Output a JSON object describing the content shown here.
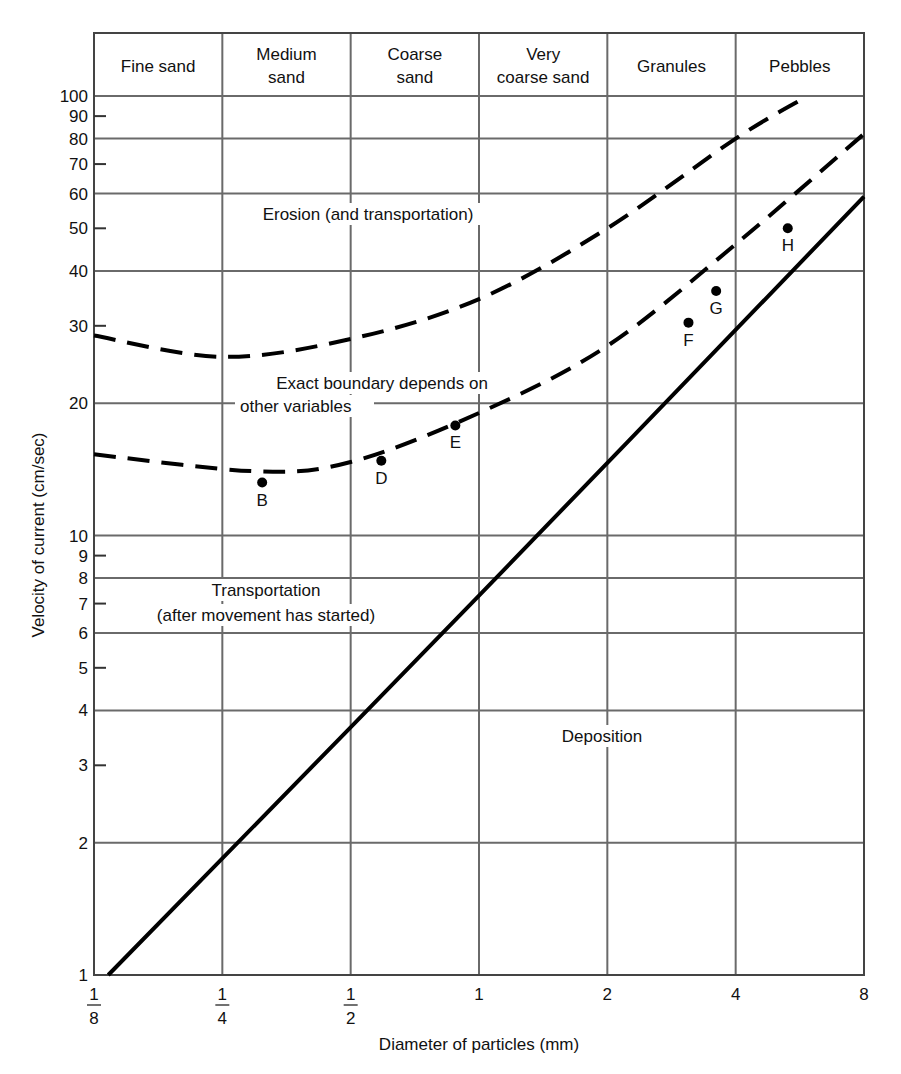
{
  "chart_data": {
    "type": "line",
    "title": "",
    "xlabel": "Diameter of particles (mm)",
    "ylabel": "Velocity of current (cm/sec)",
    "x_scale": "log2",
    "y_scale": "log10",
    "xlim": [
      0.125,
      8
    ],
    "ylim": [
      1,
      100
    ],
    "grid": true,
    "x_ticks": [
      {
        "value": 0.125,
        "num": "1",
        "den": "8"
      },
      {
        "value": 0.25,
        "num": "1",
        "den": "4"
      },
      {
        "value": 0.5,
        "num": "1",
        "den": "2"
      },
      {
        "value": 1,
        "label": "1"
      },
      {
        "value": 2,
        "label": "2"
      },
      {
        "value": 4,
        "label": "4"
      },
      {
        "value": 8,
        "label": "8"
      }
    ],
    "y_gridlines": [
      1,
      2,
      4,
      6,
      8,
      10,
      20,
      40,
      60,
      80,
      100
    ],
    "y_minor_ticks": [
      3,
      5,
      7,
      9,
      30,
      50,
      70,
      90
    ],
    "y_tick_labels": [
      "1",
      "2",
      "3",
      "4",
      "5",
      "6",
      "7",
      "8",
      "9",
      "10",
      "20",
      "30",
      "40",
      "50",
      "60",
      "70",
      "80",
      "90",
      "100"
    ],
    "size_classes": [
      "Fine sand",
      "Medium sand",
      "Coarse sand",
      "Very coarse sand",
      "Granules",
      "Pebbles"
    ],
    "series": [
      {
        "name": "Erosion threshold (upper dashed)",
        "style": "dashed",
        "x": [
          0.125,
          0.25,
          0.5,
          1,
          2,
          4,
          5.9
        ],
        "values": [
          28.5,
          25.5,
          28,
          34.5,
          50,
          80,
          100
        ]
      },
      {
        "name": "Erosion threshold (lower dashed)",
        "style": "dashed",
        "x": [
          0.125,
          0.3,
          0.5,
          1,
          2,
          4,
          8
        ],
        "values": [
          15.3,
          14,
          14.7,
          19,
          27,
          46,
          82
        ]
      },
      {
        "name": "Deposition threshold (solid)",
        "style": "solid",
        "x": [
          0.135,
          1,
          8
        ],
        "values": [
          1,
          7.3,
          59
        ]
      }
    ],
    "points": [
      {
        "label": "B",
        "x": 0.31,
        "y": 13.2
      },
      {
        "label": "D",
        "x": 0.59,
        "y": 14.8
      },
      {
        "label": "E",
        "x": 0.88,
        "y": 17.8
      },
      {
        "label": "F",
        "x": 3.1,
        "y": 30.5
      },
      {
        "label": "G",
        "x": 3.6,
        "y": 36
      },
      {
        "label": "H",
        "x": 5.3,
        "y": 50
      }
    ],
    "annotations": [
      {
        "text": "Erosion (and transportation)"
      },
      {
        "text": "Exact boundary depends on"
      },
      {
        "text": "other variables"
      },
      {
        "text": "Transportation"
      },
      {
        "text": "(after movement has started)"
      },
      {
        "text": "Deposition"
      }
    ]
  }
}
